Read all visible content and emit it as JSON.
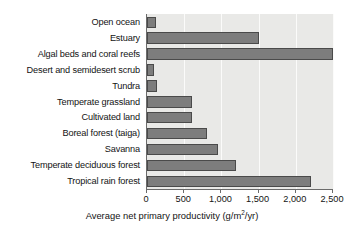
{
  "chart_data": {
    "type": "bar",
    "orientation": "horizontal",
    "title": "",
    "xlabel": "Average net primary productivity (g/m2/yr)",
    "xlabel_parts": {
      "before": "Average net primary productivity (g/m",
      "superscript": "2",
      "after": "/yr)"
    },
    "ylabel": "",
    "categories": [
      "Open ocean",
      "Estuary",
      "Algal beds and coral reefs",
      "Desert and semidesert scrub",
      "Tundra",
      "Temperate grassland",
      "Cultivated land",
      "Boreal forest (taiga)",
      "Savanna",
      "Temperate deciduous forest",
      "Tropical rain forest"
    ],
    "values": [
      125,
      1500,
      2500,
      90,
      140,
      600,
      600,
      800,
      950,
      1200,
      2200
    ],
    "xlim": [
      0,
      2500
    ],
    "xticks": [
      0,
      500,
      1000,
      1500,
      2000,
      2500
    ],
    "xtick_labels": [
      "0",
      "500",
      "1,000",
      "1,500",
      "2,000",
      "2,500"
    ],
    "grid": true,
    "grid_axis": "x",
    "legend": null,
    "bar_color": "#7d7d7d",
    "bar_edge_color": "#4a4a4a",
    "plot_background": "#e9e9e7",
    "figure_background": "#ffffff",
    "gridline_color": "#fbfbfa",
    "axis_color": "#6b6b6b"
  }
}
